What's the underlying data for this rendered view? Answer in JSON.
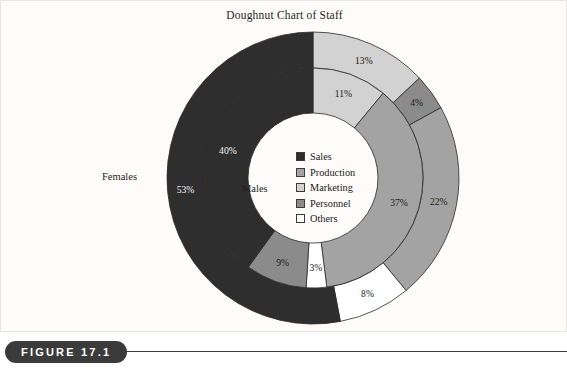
{
  "figure": {
    "caption_label": "FIGURE 17.1",
    "panel_background": "#fdfcfa",
    "rule_color": "#3b3b3b"
  },
  "chart_data": {
    "type": "pie",
    "variant": "doughnut-two-ring",
    "title": "Doughnut Chart of Staff",
    "xlabel": "",
    "ylabel": "",
    "legend_position": "center",
    "grid": false,
    "categories": [
      "Sales",
      "Production",
      "Marketing",
      "Personnel",
      "Others"
    ],
    "colors": {
      "Sales": "#2e2e2e",
      "Production": "#a3a3a3",
      "Marketing": "#d2d2d2",
      "Personnel": "#8b8b8b",
      "Others": "#ffffff"
    },
    "rings": [
      {
        "name": "Females",
        "ring": "outer",
        "label": "Females",
        "slices": [
          {
            "category": "Marketing",
            "value": 13,
            "label": "13%"
          },
          {
            "category": "Personnel",
            "value": 4,
            "label": "4%"
          },
          {
            "category": "Production",
            "value": 22,
            "label": "22%"
          },
          {
            "category": "Others",
            "value": 8,
            "label": "8%"
          },
          {
            "category": "Sales",
            "value": 53,
            "label": "53%"
          }
        ]
      },
      {
        "name": "Males",
        "ring": "inner",
        "label": "Males",
        "slices": [
          {
            "category": "Marketing",
            "value": 11,
            "label": "11%"
          },
          {
            "category": "Production",
            "value": 37,
            "label": "37%"
          },
          {
            "category": "Others",
            "value": 3,
            "label": "3%"
          },
          {
            "category": "Personnel",
            "value": 9,
            "label": "9%"
          },
          {
            "category": "Sales",
            "value": 40,
            "label": "40%"
          }
        ]
      }
    ],
    "legend": [
      {
        "label": "Sales",
        "color": "#2e2e2e"
      },
      {
        "label": "Production",
        "color": "#a3a3a3"
      },
      {
        "label": "Marketing",
        "color": "#d2d2d2"
      },
      {
        "label": "Personnel",
        "color": "#8b8b8b"
      },
      {
        "label": "Others",
        "color": "#ffffff"
      }
    ]
  }
}
